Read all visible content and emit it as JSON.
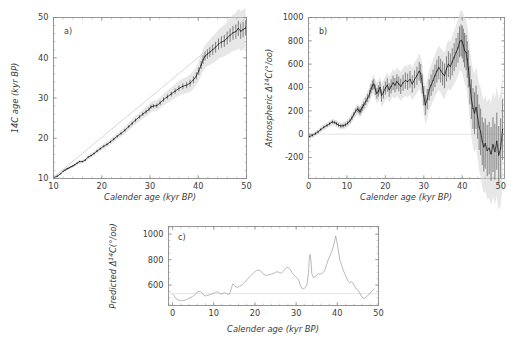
{
  "figure": {
    "background_color": "#ffffff",
    "data_color": "#141414",
    "band_color": "#d2d2d2",
    "axis_color": "#7d7d7d"
  },
  "chart_data": [
    {
      "id": "panel-a",
      "type": "scatter",
      "panel_label": "a)",
      "title": "",
      "xlabel": "Calender age (kyr BP)",
      "ylabel": "14C age (kyr BP)",
      "xlim": [
        10,
        50
      ],
      "ylim": [
        10,
        50
      ],
      "xticks": [
        10,
        20,
        30,
        40,
        50
      ],
      "yticks": [
        10,
        20,
        30,
        40,
        50
      ],
      "xminor_step": 2,
      "yminor_step": 2,
      "grid": false,
      "legend": "none",
      "annotations": [
        "1:1 reference line shown faint",
        "grey shaded 1-sigma uncertainty envelope"
      ],
      "series": [
        {
          "name": "14C age calibration",
          "x": [
            10.0,
            10.8,
            11.5,
            12.0,
            12.4,
            12.8,
            13.0,
            13.3,
            13.6,
            14.0,
            14.4,
            14.9,
            15.4,
            16.0,
            16.6,
            17.2,
            17.8,
            18.4,
            19.0,
            19.7,
            20.4,
            21.1,
            21.8,
            22.5,
            23.2,
            24.0,
            24.8,
            25.6,
            26.3,
            27.0,
            27.8,
            28.5,
            29.2,
            29.8,
            30.2,
            30.7,
            31.4,
            32.1,
            32.8,
            33.6,
            34.4,
            35.2,
            36.0,
            36.8,
            37.6,
            38.3,
            39.0,
            39.6,
            40.1,
            40.6,
            41.0,
            41.4,
            41.9,
            42.4,
            43.0,
            43.6,
            44.2,
            44.8,
            45.4,
            46.0,
            46.6,
            47.2,
            47.8,
            48.3,
            48.8,
            49.3,
            49.8
          ],
          "y": [
            10.2,
            10.6,
            11.2,
            11.8,
            12.1,
            12.4,
            12.5,
            12.7,
            12.9,
            13.1,
            13.4,
            13.8,
            14.2,
            14.2,
            14.6,
            15.3,
            15.7,
            16.2,
            16.8,
            17.4,
            18.0,
            18.5,
            19.1,
            19.8,
            20.5,
            21.2,
            22.0,
            22.9,
            23.7,
            24.5,
            25.3,
            26.0,
            26.6,
            27.2,
            27.8,
            28.0,
            28.1,
            28.8,
            29.6,
            30.3,
            31.0,
            31.7,
            32.4,
            32.9,
            33.2,
            33.7,
            34.5,
            35.5,
            36.7,
            38.2,
            39.5,
            40.4,
            40.9,
            41.4,
            42.0,
            42.6,
            43.4,
            43.9,
            44.2,
            44.9,
            45.6,
            46.2,
            46.5,
            47.3,
            46.6,
            47.0,
            47.4
          ],
          "yerr": [
            0.15,
            0.15,
            0.15,
            0.15,
            0.15,
            0.15,
            0.15,
            0.15,
            0.15,
            0.16,
            0.16,
            0.17,
            0.18,
            0.18,
            0.2,
            0.2,
            0.22,
            0.22,
            0.24,
            0.25,
            0.26,
            0.27,
            0.28,
            0.3,
            0.3,
            0.32,
            0.34,
            0.36,
            0.38,
            0.4,
            0.42,
            0.44,
            0.46,
            0.48,
            0.5,
            0.5,
            0.52,
            0.54,
            0.56,
            0.6,
            0.62,
            0.66,
            0.7,
            0.74,
            0.78,
            0.82,
            0.86,
            0.9,
            0.95,
            1.0,
            1.05,
            1.1,
            1.15,
            1.2,
            1.3,
            1.35,
            1.4,
            1.45,
            1.5,
            1.6,
            1.7,
            1.75,
            1.8,
            1.9,
            1.9,
            1.9,
            1.9
          ]
        }
      ]
    },
    {
      "id": "panel-b",
      "type": "scatter",
      "panel_label": "b)",
      "title": "",
      "xlabel": "Calender age (kyr BP)",
      "ylabel": "Atmospheric Δ14C (o/oo)",
      "ylabel_parts": {
        "prefix": "Atmospheric ",
        "delta": "Δ",
        "sup": "14",
        "symbol": "C",
        "units": "(°/oo)"
      },
      "xlim": [
        0,
        51
      ],
      "ylim": [
        -380,
        1000
      ],
      "xticks": [
        0,
        10,
        20,
        30,
        40,
        50
      ],
      "yticks": [
        -200,
        0,
        200,
        400,
        600,
        800,
        1000
      ],
      "xminor_step": 2,
      "yminor_step": 50,
      "grid": false,
      "legend": "none",
      "annotations": [
        "zero reference line at 0 per mil",
        "grey shaded uncertainty envelope widening after 40 kyr"
      ],
      "series": [
        {
          "name": "Atmospheric Delta14C",
          "x": [
            0.3,
            1.0,
            1.8,
            2.5,
            3.2,
            4.0,
            4.8,
            5.5,
            6.2,
            6.8,
            7.3,
            7.8,
            8.4,
            9.0,
            9.6,
            10.2,
            10.8,
            11.3,
            11.8,
            12.3,
            12.8,
            13.1,
            13.4,
            13.7,
            14.0,
            14.4,
            14.9,
            15.4,
            15.9,
            16.3,
            16.7,
            17.0,
            17.4,
            17.8,
            18.2,
            18.6,
            19.0,
            19.5,
            20.0,
            20.5,
            21.0,
            21.5,
            22.0,
            22.5,
            23.0,
            23.5,
            24.0,
            24.6,
            25.2,
            25.8,
            26.4,
            27.0,
            27.6,
            28.2,
            28.8,
            29.2,
            29.6,
            30.0,
            30.4,
            30.9,
            31.4,
            31.9,
            32.4,
            32.9,
            33.4,
            33.9,
            34.4,
            34.9,
            35.4,
            35.9,
            36.4,
            36.9,
            37.4,
            37.9,
            38.4,
            38.9,
            39.3,
            39.7,
            40.0,
            40.3,
            40.6,
            41.0,
            41.3,
            41.6,
            42.0,
            42.4,
            42.8,
            43.2,
            43.6,
            44.0,
            44.4,
            44.8,
            45.2,
            45.6,
            46.0,
            46.5,
            47.0,
            47.5,
            48.0,
            48.5,
            49.0,
            49.5,
            50.0,
            50.5
          ],
          "y": [
            -20,
            -10,
            5,
            20,
            40,
            60,
            75,
            90,
            105,
            100,
            90,
            78,
            70,
            72,
            80,
            95,
            115,
            140,
            170,
            200,
            215,
            205,
            190,
            210,
            230,
            250,
            280,
            310,
            345,
            390,
            420,
            430,
            380,
            350,
            370,
            400,
            330,
            360,
            395,
            420,
            380,
            410,
            440,
            420,
            450,
            430,
            410,
            440,
            460,
            450,
            470,
            430,
            470,
            500,
            540,
            520,
            430,
            330,
            250,
            300,
            380,
            420,
            460,
            500,
            540,
            570,
            545,
            520,
            500,
            560,
            600,
            580,
            620,
            660,
            700,
            740,
            790,
            805,
            790,
            760,
            720,
            700,
            640,
            560,
            420,
            300,
            220,
            180,
            230,
            150,
            60,
            20,
            -60,
            -110,
            -80,
            -140,
            -120,
            -170,
            -90,
            -150,
            -60,
            -180,
            -120,
            40
          ],
          "yerr": [
            12,
            12,
            12,
            12,
            12,
            13,
            13,
            14,
            14,
            14,
            15,
            15,
            16,
            16,
            17,
            18,
            19,
            20,
            20,
            22,
            24,
            25,
            26,
            26,
            28,
            30,
            32,
            34,
            36,
            38,
            40,
            42,
            44,
            46,
            48,
            50,
            52,
            54,
            56,
            58,
            58,
            60,
            62,
            62,
            64,
            64,
            66,
            68,
            70,
            70,
            72,
            74,
            76,
            78,
            80,
            82,
            82,
            84,
            86,
            88,
            90,
            92,
            94,
            96,
            98,
            100,
            102,
            104,
            106,
            108,
            110,
            112,
            116,
            120,
            124,
            128,
            132,
            136,
            140,
            144,
            148,
            152,
            156,
            160,
            165,
            170,
            175,
            180,
            185,
            190,
            195,
            200,
            205,
            210,
            215,
            220,
            225,
            230,
            235,
            240,
            245,
            250,
            255,
            260
          ]
        }
      ]
    },
    {
      "id": "panel-c",
      "type": "line",
      "panel_label": "c)",
      "title": "",
      "xlabel": "Calender age (kyr BP)",
      "ylabel": "Predicted Δ14C (o/oo)",
      "ylabel_parts": {
        "prefix": "Predicted ",
        "delta": "Δ",
        "sup": "14",
        "symbol": "C",
        "units": "(°/oo)"
      },
      "xlim": [
        -1,
        50
      ],
      "ylim": [
        440,
        1060
      ],
      "xticks": [
        0,
        10,
        20,
        30,
        40,
        50
      ],
      "yticks": [
        600,
        800,
        1000
      ],
      "xminor_step": 2,
      "yminor_step": 50,
      "grid": false,
      "legend": "none",
      "annotations": [
        "faint horizontal reference line near 530 per mil"
      ],
      "series": [
        {
          "name": "Predicted Delta14C",
          "x": [
            0.0,
            0.4,
            0.8,
            1.2,
            1.8,
            2.4,
            3.0,
            3.6,
            4.2,
            4.8,
            5.2,
            5.6,
            6.0,
            6.4,
            6.8,
            7.2,
            7.6,
            8.0,
            8.6,
            9.2,
            9.8,
            10.2,
            10.6,
            11.0,
            11.4,
            11.8,
            12.2,
            12.6,
            13.0,
            13.4,
            13.8,
            14.0,
            14.3,
            14.6,
            15.0,
            15.4,
            15.8,
            16.2,
            16.8,
            17.4,
            18.0,
            18.6,
            19.2,
            19.8,
            20.4,
            21.0,
            21.6,
            22.0,
            22.4,
            22.8,
            23.2,
            23.8,
            24.4,
            25.0,
            25.4,
            25.8,
            26.2,
            26.6,
            27.0,
            27.4,
            27.8,
            28.2,
            28.6,
            29.0,
            29.4,
            29.8,
            30.2,
            30.6,
            31.0,
            31.4,
            31.8,
            32.2,
            32.6,
            33.0,
            33.2,
            33.4,
            33.6,
            33.8,
            34.2,
            34.6,
            35.0,
            35.4,
            35.8,
            36.2,
            36.6,
            37.0,
            37.4,
            37.8,
            38.2,
            38.6,
            39.0,
            39.4,
            39.6,
            39.8,
            40.2,
            40.6,
            41.0,
            41.4,
            41.8,
            42.2,
            42.6,
            43.0,
            43.4,
            43.8,
            44.2,
            44.6,
            45.0,
            45.4,
            45.8,
            46.2,
            46.6,
            47.0,
            47.4,
            47.8,
            48.2,
            48.6,
            49.0
          ],
          "y": [
            530,
            515,
            495,
            485,
            480,
            478,
            482,
            490,
            500,
            510,
            520,
            530,
            545,
            552,
            548,
            535,
            520,
            515,
            520,
            527,
            532,
            540,
            548,
            545,
            535,
            530,
            535,
            540,
            535,
            528,
            530,
            545,
            580,
            608,
            600,
            585,
            580,
            590,
            600,
            620,
            640,
            662,
            680,
            700,
            715,
            718,
            705,
            688,
            680,
            676,
            680,
            684,
            690,
            700,
            705,
            700,
            694,
            700,
            712,
            730,
            740,
            735,
            720,
            700,
            682,
            668,
            655,
            640,
            600,
            575,
            570,
            580,
            600,
            700,
            810,
            840,
            790,
            690,
            660,
            665,
            680,
            690,
            685,
            690,
            700,
            720,
            760,
            800,
            830,
            860,
            900,
            955,
            985,
            960,
            880,
            800,
            760,
            720,
            690,
            660,
            630,
            620,
            625,
            615,
            590,
            570,
            560,
            540,
            515,
            500,
            495,
            505,
            520,
            530,
            545,
            560,
            572
          ]
        }
      ]
    }
  ]
}
